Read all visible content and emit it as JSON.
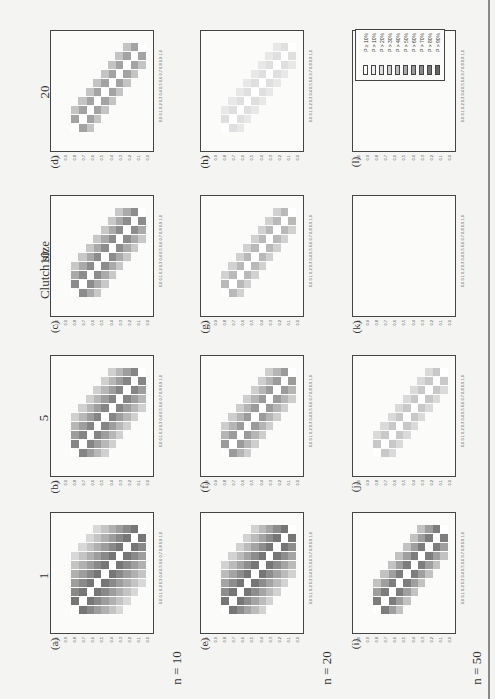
{
  "figure": {
    "row_header": "Clutch size",
    "clutch_sizes": [
      "20",
      "10",
      "5",
      "1"
    ],
    "sample_sizes": [
      "n = 10",
      "n = 20",
      "n = 50"
    ],
    "panel_labels": {
      "n10": [
        "(d)",
        "(c)",
        "(b)",
        "(a)"
      ],
      "n20": [
        "(h)",
        "(g)",
        "(f)",
        "(e)"
      ],
      "n50": [
        "(l)",
        "(k)",
        "(j)",
        "(i)"
      ]
    },
    "tick_labels": "0.0 0.1 0.2 0.3 0.4 0.5 0.6 0.7 0.8 0.9 1.0",
    "legend": {
      "entries": [
        "P ≥ 10%",
        "P > 10%",
        "P > 20%",
        "P > 30%",
        "P > 40%",
        "P > 50%",
        "P > 60%",
        "P > 70%",
        "P > 80%",
        "P > 90%"
      ],
      "colors": [
        "#ffffff",
        "#efefef",
        "#dedede",
        "#cdcdcd",
        "#bcbcbc",
        "#ababab",
        "#9a9a9a",
        "#898989",
        "#787878",
        "#666666"
      ]
    }
  },
  "chart_data": {
    "type": "heatmap",
    "title": "",
    "xlabel": "",
    "ylabel": "",
    "xlim": [
      0,
      1
    ],
    "ylim": [
      0,
      1
    ],
    "ticks": [
      0.0,
      0.1,
      0.2,
      0.3,
      0.4,
      0.5,
      0.6,
      0.7,
      0.8,
      0.9,
      1.0
    ],
    "grid": false,
    "legend_position": "top-right panel (l)",
    "legend": [
      "P ≥ 10%",
      "P > 10%",
      "P > 20%",
      "P > 30%",
      "P > 40%",
      "P > 50%",
      "P > 60%",
      "P > 70%",
      "P > 80%",
      "P > 90%"
    ],
    "row_factor": {
      "name": "Clutch size",
      "levels": [
        1,
        5,
        10,
        20
      ]
    },
    "col_factor": {
      "name": "n",
      "levels": [
        10,
        20,
        50
      ]
    },
    "panels": [
      {
        "id": "a",
        "clutch": 1,
        "n": 10,
        "band_halfwidth": 5,
        "peak": 0.85
      },
      {
        "id": "b",
        "clutch": 5,
        "n": 10,
        "band_halfwidth": 3,
        "peak": 0.75
      },
      {
        "id": "c",
        "clutch": 10,
        "n": 10,
        "band_halfwidth": 2,
        "peak": 0.7
      },
      {
        "id": "d",
        "clutch": 20,
        "n": 10,
        "band_halfwidth": 1,
        "peak": 0.55
      },
      {
        "id": "e",
        "clutch": 1,
        "n": 20,
        "band_halfwidth": 4,
        "peak": 0.85
      },
      {
        "id": "f",
        "clutch": 5,
        "n": 20,
        "band_halfwidth": 2,
        "peak": 0.6
      },
      {
        "id": "g",
        "clutch": 10,
        "n": 20,
        "band_halfwidth": 1,
        "peak": 0.4
      },
      {
        "id": "h",
        "clutch": 20,
        "n": 20,
        "band_halfwidth": 1,
        "peak": 0.15
      },
      {
        "id": "i",
        "clutch": 1,
        "n": 50,
        "band_halfwidth": 2,
        "peak": 0.8
      },
      {
        "id": "j",
        "clutch": 5,
        "n": 50,
        "band_halfwidth": 1,
        "peak": 0.3
      },
      {
        "id": "k",
        "clutch": 10,
        "n": 50,
        "band_halfwidth": 0,
        "peak": 0.0
      },
      {
        "id": "l",
        "clutch": 20,
        "n": 50,
        "band_halfwidth": 0,
        "peak": 0.0
      }
    ],
    "note": "Diagonal cells (x == y) are white in every panel; shading decreases with distance from the diagonal."
  }
}
